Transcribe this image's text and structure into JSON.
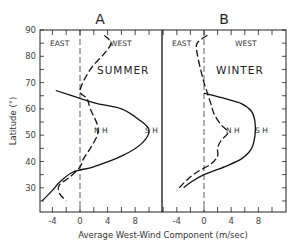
{
  "chart_data": [
    {
      "type": "line",
      "panel": "A",
      "title": "A",
      "season": "SUMMER",
      "xlabel": "Average West-Wind Component (m/sec)",
      "ylabel": "Latitude (°)",
      "xlim": [
        -6,
        12
      ],
      "ylim": [
        22,
        90
      ],
      "xticks": [
        -4,
        0,
        4,
        8
      ],
      "yticks": [
        30,
        40,
        50,
        60,
        70,
        80,
        90
      ],
      "region_labels": [
        "EAST",
        "WEST"
      ],
      "series": [
        {
          "name": "NH",
          "style": "dashed",
          "points": [
            [
              3.5,
              88
            ],
            [
              4.5,
              85
            ],
            [
              3.5,
              81
            ],
            [
              1.5,
              75
            ],
            [
              0,
              67
            ],
            [
              1,
              64
            ],
            [
              1.5,
              60
            ],
            [
              2.5,
              54
            ],
            [
              2.5,
              50
            ],
            [
              1.5,
              45
            ],
            [
              0.5,
              41
            ],
            [
              0,
              38
            ],
            [
              -1.5,
              34
            ],
            [
              -3,
              31
            ],
            [
              -3,
              28
            ],
            [
              -2,
              25
            ]
          ]
        },
        {
          "name": "SH",
          "style": "solid",
          "points": [
            [
              -3.5,
              67
            ],
            [
              0,
              64
            ],
            [
              2.5,
              62
            ],
            [
              6,
              60
            ],
            [
              8.5,
              56
            ],
            [
              10,
              52
            ],
            [
              9,
              47
            ],
            [
              6,
              42
            ],
            [
              2,
              38
            ],
            [
              -1,
              36
            ],
            [
              -3,
              32
            ],
            [
              -4,
              29
            ],
            [
              -5.5,
              25
            ]
          ]
        }
      ]
    },
    {
      "type": "line",
      "panel": "B",
      "title": "B",
      "season": "WINTER",
      "xlabel": "Average West-Wind Component (m/sec)",
      "ylabel": "Latitude (°)",
      "xlim": [
        -6,
        12
      ],
      "ylim": [
        22,
        90
      ],
      "xticks": [
        -4,
        0,
        4,
        8
      ],
      "yticks": [
        30,
        40,
        50,
        60,
        70,
        80,
        90
      ],
      "region_labels": [
        "EAST",
        "WEST"
      ],
      "series": [
        {
          "name": "NH",
          "style": "dashed",
          "points": [
            [
              0.5,
              88
            ],
            [
              -1,
              85
            ],
            [
              -1,
              81
            ],
            [
              -0.5,
              75
            ],
            [
              0,
              70
            ],
            [
              0.5,
              66
            ],
            [
              1,
              62
            ],
            [
              1.5,
              58
            ],
            [
              2.5,
              54
            ],
            [
              3.5,
              51
            ],
            [
              2.5,
              48
            ],
            [
              2,
              45
            ],
            [
              2,
              42
            ],
            [
              1,
              39
            ],
            [
              -1,
              36
            ],
            [
              -2.5,
              33
            ],
            [
              -4,
              29
            ]
          ]
        },
        {
          "name": "SH",
          "style": "solid",
          "points": [
            [
              0,
              66
            ],
            [
              3,
              64
            ],
            [
              5.5,
              62
            ],
            [
              7,
              59
            ],
            [
              7.5,
              55
            ],
            [
              7.5,
              50
            ],
            [
              7,
              45
            ],
            [
              5.5,
              41
            ],
            [
              3,
              38
            ],
            [
              0,
              35
            ],
            [
              -2,
              32
            ],
            [
              -3,
              30
            ]
          ]
        }
      ]
    }
  ],
  "labels": {
    "panel_a": "A",
    "panel_b": "B",
    "summer": "SUMMER",
    "winter": "WINTER",
    "east": "EAST",
    "west": "WEST",
    "nh": "N H",
    "sh": "S H",
    "ylabel": "Latitude (°)",
    "xlabel": "Average West-Wind Component (m/sec)",
    "yticks": [
      "90",
      "80",
      "70",
      "60",
      "50",
      "40",
      "30"
    ],
    "xticks": [
      "-4",
      "0",
      "4",
      "8"
    ]
  }
}
